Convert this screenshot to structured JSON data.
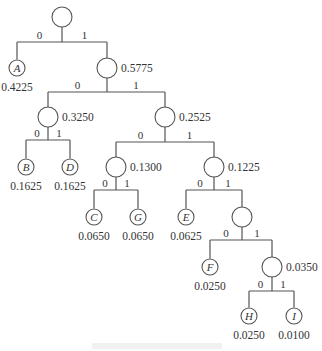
{
  "diagram": {
    "type": "huffman-tree",
    "nodes": [
      {
        "id": "root",
        "x": 62,
        "y": 17,
        "name": "",
        "weight": "",
        "leaf": false
      },
      {
        "id": "A",
        "x": 17,
        "y": 68,
        "name": "A",
        "weight": "0.4225",
        "leaf": true
      },
      {
        "id": "n5775",
        "x": 107,
        "y": 68,
        "name": "",
        "weight": "0.5775",
        "leaf": false
      },
      {
        "id": "n3250",
        "x": 48,
        "y": 117,
        "name": "",
        "weight": "0.3250",
        "leaf": false
      },
      {
        "id": "n2525",
        "x": 165,
        "y": 117,
        "name": "",
        "weight": "0.2525",
        "leaf": false
      },
      {
        "id": "B",
        "x": 26,
        "y": 167,
        "name": "B",
        "weight": "0.1625",
        "leaf": true
      },
      {
        "id": "D",
        "x": 70,
        "y": 167,
        "name": "D",
        "weight": "0.1625",
        "leaf": true
      },
      {
        "id": "n1300",
        "x": 116,
        "y": 167,
        "name": "",
        "weight": "0.1300",
        "leaf": false
      },
      {
        "id": "n1225",
        "x": 214,
        "y": 167,
        "name": "",
        "weight": "0.1225",
        "leaf": false
      },
      {
        "id": "C",
        "x": 94,
        "y": 217,
        "name": "C",
        "weight": "0.0650",
        "leaf": true
      },
      {
        "id": "G",
        "x": 138,
        "y": 217,
        "name": "G",
        "weight": "0.0650",
        "leaf": true
      },
      {
        "id": "E",
        "x": 186,
        "y": 217,
        "name": "E",
        "weight": "0.0625",
        "leaf": true
      },
      {
        "id": "n0600",
        "x": 242,
        "y": 217,
        "name": "",
        "weight": "",
        "leaf": false
      },
      {
        "id": "F",
        "x": 210,
        "y": 267,
        "name": "F",
        "weight": "0.0250",
        "leaf": true
      },
      {
        "id": "n0350",
        "x": 272,
        "y": 267,
        "name": "",
        "weight": "0.0350",
        "leaf": false
      },
      {
        "id": "H",
        "x": 249,
        "y": 316,
        "name": "H",
        "weight": "0.0250",
        "leaf": true
      },
      {
        "id": "I",
        "x": 294,
        "y": 316,
        "name": "I",
        "weight": "0.0100",
        "leaf": true
      }
    ],
    "branches": [
      {
        "parent": "root",
        "barY": 42,
        "left": "A",
        "right": "n5775",
        "bit0": "0",
        "bit1": "1"
      },
      {
        "parent": "n5775",
        "barY": 92,
        "left": "n3250",
        "right": "n2525",
        "bit0": "0",
        "bit1": "1"
      },
      {
        "parent": "n3250",
        "barY": 140,
        "left": "B",
        "right": "D",
        "bit0": "0",
        "bit1": "1"
      },
      {
        "parent": "n2525",
        "barY": 142,
        "left": "n1300",
        "right": "n1225",
        "bit0": "0",
        "bit1": "1"
      },
      {
        "parent": "n1300",
        "barY": 190,
        "left": "C",
        "right": "G",
        "bit0": "0",
        "bit1": "1"
      },
      {
        "parent": "n1225",
        "barY": 190,
        "left": "E",
        "right": "n0600",
        "bit0": "0",
        "bit1": "1"
      },
      {
        "parent": "n0600",
        "barY": 240,
        "left": "F",
        "right": "n0350",
        "bit0": "0",
        "bit1": "1"
      },
      {
        "parent": "n0350",
        "barY": 291,
        "left": "H",
        "right": "I",
        "bit0": "0",
        "bit1": "1"
      }
    ],
    "caption": ""
  },
  "colors": {
    "line": "#555555",
    "text": "#333333",
    "background": "#ffffff"
  }
}
